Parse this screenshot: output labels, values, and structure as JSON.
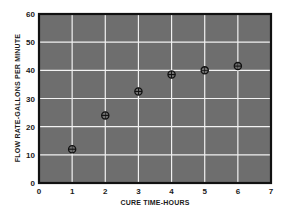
{
  "chart_data": {
    "type": "scatter",
    "title": "",
    "xlabel": "CURE TIME-HOURS",
    "ylabel": "FLOW RATE-GALLONS PER MINUTE",
    "xlim": [
      0,
      7
    ],
    "ylim": [
      0,
      60
    ],
    "xticks": [
      0,
      1,
      2,
      3,
      4,
      5,
      6,
      7
    ],
    "yticks": [
      0,
      10,
      20,
      30,
      40,
      50,
      60
    ],
    "grid": true,
    "legend": null,
    "series": [
      {
        "name": "Flow rate",
        "marker": "circle-cross",
        "x": [
          1,
          2,
          3,
          4,
          5,
          6
        ],
        "y": [
          12,
          24,
          32.5,
          38.5,
          40,
          41.5
        ]
      }
    ]
  },
  "colors": {
    "plot_background": "#6e6e6e",
    "grid": "#f2f2f2",
    "frame": "#111111",
    "marker": "#111111",
    "text": "#1a1a1a"
  }
}
